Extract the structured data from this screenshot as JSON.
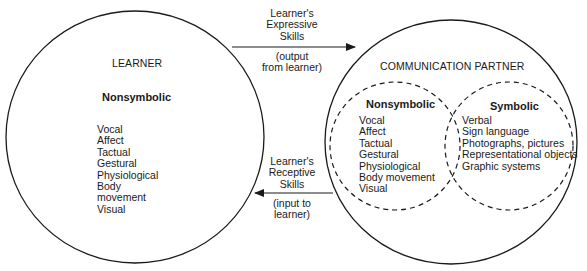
{
  "learner": {
    "title": "LEARNER",
    "heading": "Nonsymbolic",
    "items": [
      "Vocal",
      "Affect",
      "Tactual",
      "Gestural",
      "Physiological",
      "Body",
      "movement",
      "Visual"
    ]
  },
  "expressive_arrow": {
    "label_line1": "Learner's",
    "label_line2": "Expressive",
    "label_line3": "Skills",
    "note_line1": "(output",
    "note_line2": "from learner)",
    "direction": "learner-to-partner"
  },
  "receptive_arrow": {
    "label_line1": "Learner's",
    "label_line2": "Receptive",
    "label_line3": "Skills",
    "note_line1": "(input to",
    "note_line2": "learner)",
    "direction": "partner-to-learner"
  },
  "partner": {
    "title": "COMMUNICATION PARTNER",
    "nonsymbolic": {
      "heading": "Nonsymbolic",
      "items": [
        "Vocal",
        "Affect",
        "Tactual",
        "Gestural",
        "Physiological",
        "Body movement",
        "Visual"
      ]
    },
    "symbolic": {
      "heading": "Symbolic",
      "items": [
        "Verbal",
        "Sign language",
        "Photographs, pictures",
        "Representational objects",
        "Graphic systems"
      ]
    }
  },
  "colors": {
    "stroke": "#1a1a1a",
    "background": "#ffffff"
  }
}
